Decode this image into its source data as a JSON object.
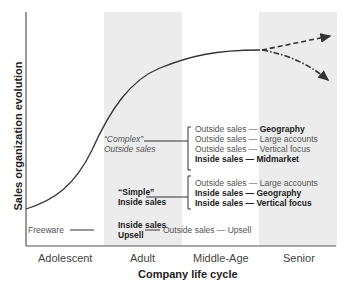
{
  "axes": {
    "y_label": "Sales organization evolution",
    "x_label": "Company life cycle",
    "x_ticks": [
      "Adolescent",
      "Adult",
      "Middle-Age",
      "Senior"
    ]
  },
  "stages": {
    "freeware": "Freeware",
    "inside_upsell": {
      "line1": "Inside sales",
      "line2": "Upsell"
    },
    "outside_upsell": {
      "prefix": "Outside sales — ",
      "focus": "Upsell"
    },
    "simple": {
      "line1": "“Simple”",
      "line2": "Inside sales",
      "items": [
        {
          "prefix": "Outside sales — ",
          "focus": "Large accounts",
          "bold": false
        },
        {
          "prefix": "Inside sales — ",
          "focus": "Geography",
          "bold": true
        },
        {
          "prefix": "Inside sales — ",
          "focus": "Vertical focus",
          "bold": true
        }
      ]
    },
    "complex": {
      "line1": "“Complex”",
      "line2": "Outside sales",
      "items": [
        {
          "prefix": "Outside sales — ",
          "focus": "Geography",
          "bold": false
        },
        {
          "prefix": "Outside sales — ",
          "focus": "Large accounts",
          "bold": false
        },
        {
          "prefix": "Outside sales — ",
          "focus": "Vertical focus",
          "bold": false
        },
        {
          "prefix": "Inside sales — ",
          "focus": "Midmarket",
          "bold": true
        }
      ]
    }
  },
  "colors": {
    "band": "#ececec",
    "curve": "#333333",
    "axis": "#555555"
  }
}
